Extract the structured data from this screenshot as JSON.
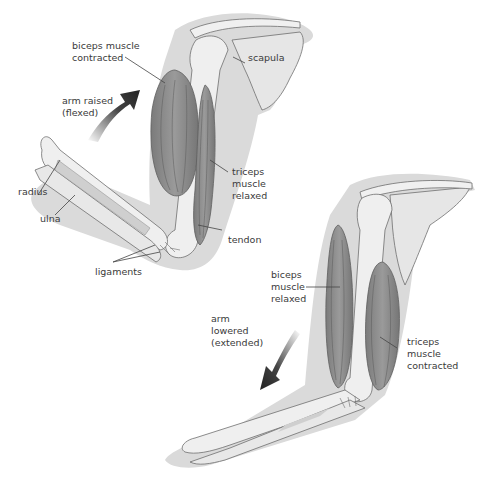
{
  "diagram": {
    "title": "",
    "colors": {
      "background": "#ffffff",
      "skin_shadow": "#d9d9d9",
      "bone": "#ececec",
      "bone_outline": "#6f6f6f",
      "muscle": "#8d8d8d",
      "muscle_dark": "#707070",
      "arrow": "#333333",
      "label": "#3a3a3a"
    },
    "top_figure": {
      "state": "flexed",
      "labels": {
        "biceps": "biceps muscle\ncontracted",
        "scapula": "scapula",
        "arrow": "arm raised\n(flexed)",
        "triceps": "triceps\nmuscle\nrelaxed",
        "radius": "radius",
        "ulna": "ulna",
        "tendon": "tendon",
        "ligaments": "ligaments"
      }
    },
    "bottom_figure": {
      "state": "extended",
      "labels": {
        "biceps": "biceps\nmuscle\nrelaxed",
        "arrow": "arm\nlowered\n(extended)",
        "triceps": "triceps\nmuscle\ncontracted"
      }
    }
  }
}
